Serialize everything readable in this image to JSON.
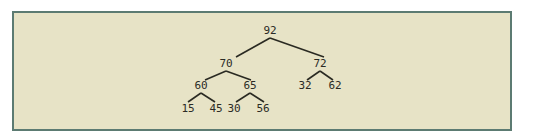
{
  "diagram": {
    "type": "binary-tree",
    "colors": {
      "panel_background": "#e7e3c6",
      "panel_border": "#5c7b72",
      "edge": "#2a2a22",
      "text": "#2b2b25"
    },
    "nodes": [
      {
        "id": "n0",
        "value": "92",
        "x": 277,
        "y": 31
      },
      {
        "id": "n1",
        "value": "70",
        "x": 231,
        "y": 65
      },
      {
        "id": "n2",
        "value": "72",
        "x": 326,
        "y": 65
      },
      {
        "id": "n3",
        "value": "60",
        "x": 206,
        "y": 87
      },
      {
        "id": "n4",
        "value": "65",
        "x": 255,
        "y": 87
      },
      {
        "id": "n5",
        "value": "32",
        "x": 314,
        "y": 87
      },
      {
        "id": "n6",
        "value": "62",
        "x": 343,
        "y": 87
      },
      {
        "id": "n7",
        "value": "15",
        "x": 193,
        "y": 109
      },
      {
        "id": "n8",
        "value": "45",
        "x": 222,
        "y": 109
      },
      {
        "id": "n9",
        "value": "30",
        "x": 237,
        "y": 109
      },
      {
        "id": "n10",
        "value": "56",
        "x": 266,
        "y": 109
      }
    ],
    "edges": [
      {
        "from": "n0",
        "to": "n1"
      },
      {
        "from": "n0",
        "to": "n2"
      },
      {
        "from": "n1",
        "to": "n3"
      },
      {
        "from": "n1",
        "to": "n4"
      },
      {
        "from": "n2",
        "to": "n5"
      },
      {
        "from": "n2",
        "to": "n6"
      },
      {
        "from": "n3",
        "to": "n7"
      },
      {
        "from": "n3",
        "to": "n8"
      },
      {
        "from": "n4",
        "to": "n9"
      },
      {
        "from": "n4",
        "to": "n10"
      }
    ]
  }
}
